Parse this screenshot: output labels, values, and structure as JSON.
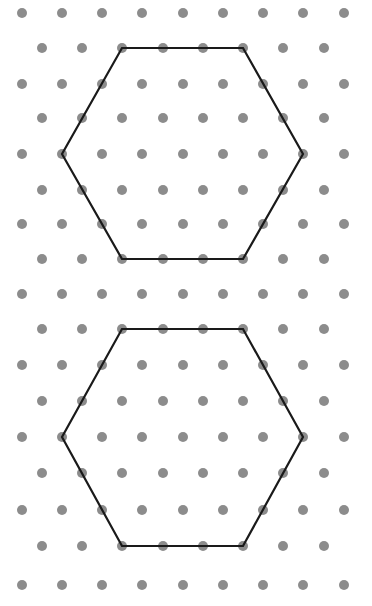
{
  "diagram": {
    "type": "isometric-dot-grid",
    "background": "#ffffff",
    "dot_color": "#8c8c8c",
    "dot_radius": 5,
    "line_color": "#1a1a1a",
    "line_width": 2.2,
    "rows_y": [
      13,
      48,
      84,
      118,
      154,
      190,
      224,
      259,
      294,
      329,
      365,
      401,
      437,
      473,
      510,
      546,
      585
    ],
    "even_row_x": [
      22,
      62,
      102,
      142,
      183,
      223,
      263,
      303,
      344
    ],
    "odd_row_x": [
      42,
      82,
      122,
      163,
      203,
      243,
      283,
      324
    ],
    "shapes": [
      {
        "name": "hexagon-top",
        "points": [
          [
            122,
            48
          ],
          [
            243,
            48
          ],
          [
            303,
            154
          ],
          [
            243,
            259
          ],
          [
            122,
            259
          ],
          [
            62,
            154
          ]
        ]
      },
      {
        "name": "hexagon-bottom",
        "points": [
          [
            122,
            329
          ],
          [
            243,
            329
          ],
          [
            303,
            437
          ],
          [
            243,
            546
          ],
          [
            122,
            546
          ],
          [
            62,
            437
          ]
        ]
      }
    ]
  }
}
